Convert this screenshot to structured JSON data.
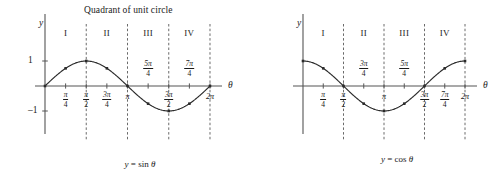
{
  "figure": {
    "background": "#ffffff",
    "ink_color": "#1a1a1a",
    "curve_color": "#2b2b2b",
    "axis_color": "#555555",
    "dash_color": "#444444"
  },
  "chart_data": [
    {
      "type": "line",
      "id": "sine-plot",
      "title": "Quadrant of unit circle",
      "caption": "y = sin θ",
      "caption_parts": {
        "y": "y",
        "eq": " = sin ",
        "theta": "θ"
      },
      "xlabel": "θ",
      "ylabel": "y",
      "xlim": [
        0,
        6.283185
      ],
      "ylim": [
        -1.45,
        1.45
      ],
      "grid": false,
      "legend": "none",
      "x": [
        0,
        0.785398,
        1.570796,
        2.356194,
        3.141593,
        3.926991,
        4.712389,
        5.497787,
        6.283185
      ],
      "values": [
        0,
        0.7071,
        1,
        0.7071,
        0,
        -0.7071,
        -1,
        -0.7071,
        0
      ],
      "x_tick_labels": [
        {
          "value": 0.785398,
          "num": "π",
          "den": "4",
          "position": "below"
        },
        {
          "value": 1.570796,
          "num": "π",
          "den": "2",
          "position": "below"
        },
        {
          "value": 2.356194,
          "num": "3π",
          "den": "4",
          "position": "below"
        },
        {
          "value": 3.141593,
          "text": "π",
          "position": "below"
        },
        {
          "value": 3.926991,
          "num": "5π",
          "den": "4",
          "position": "above"
        },
        {
          "value": 4.712389,
          "num": "3π",
          "den": "2",
          "position": "below"
        },
        {
          "value": 5.497787,
          "num": "7π",
          "den": "4",
          "position": "above"
        },
        {
          "value": 6.283185,
          "text": "2π",
          "position": "below"
        }
      ],
      "y_tick_labels": [
        {
          "value": 1,
          "text": "1"
        },
        {
          "value": -1,
          "text": "–1"
        }
      ],
      "quadrants": [
        {
          "label": "I",
          "center": 0.785398
        },
        {
          "label": "II",
          "center": 2.356194
        },
        {
          "label": "III",
          "center": 3.926991
        },
        {
          "label": "IV",
          "center": 5.497787
        }
      ],
      "quadrant_dividers": [
        1.570796,
        3.141593,
        4.712389,
        6.283185
      ]
    },
    {
      "type": "line",
      "id": "cosine-plot",
      "title": "",
      "caption": "y = cos θ",
      "caption_parts": {
        "y": "y",
        "eq": " = cos ",
        "theta": "θ"
      },
      "xlabel": "θ",
      "ylabel": "y",
      "xlim": [
        0,
        6.283185
      ],
      "ylim": [
        -1.45,
        1.45
      ],
      "grid": false,
      "legend": "none",
      "x": [
        0,
        0.785398,
        1.570796,
        2.356194,
        3.141593,
        3.926991,
        4.712389,
        5.497787,
        6.283185
      ],
      "values": [
        1,
        0.7071,
        0,
        -0.7071,
        -1,
        -0.7071,
        0,
        0.7071,
        1
      ],
      "x_tick_labels": [
        {
          "value": 0.785398,
          "num": "π",
          "den": "4",
          "position": "below"
        },
        {
          "value": 1.570796,
          "num": "π",
          "den": "2",
          "position": "below"
        },
        {
          "value": 2.356194,
          "num": "3π",
          "den": "4",
          "position": "above"
        },
        {
          "value": 3.141593,
          "text": "π",
          "position": "below"
        },
        {
          "value": 3.926991,
          "num": "5π",
          "den": "4",
          "position": "above"
        },
        {
          "value": 4.712389,
          "num": "3π",
          "den": "2",
          "position": "below"
        },
        {
          "value": 5.497787,
          "num": "7π",
          "den": "4",
          "position": "below"
        },
        {
          "value": 6.283185,
          "text": "2π",
          "position": "below"
        }
      ],
      "y_tick_labels": [],
      "quadrants": [
        {
          "label": "I",
          "center": 0.785398
        },
        {
          "label": "II",
          "center": 2.356194
        },
        {
          "label": "III",
          "center": 3.926991
        },
        {
          "label": "IV",
          "center": 5.497787
        }
      ],
      "quadrant_dividers": [
        1.570796,
        3.141593,
        4.712389,
        6.283185
      ]
    }
  ]
}
